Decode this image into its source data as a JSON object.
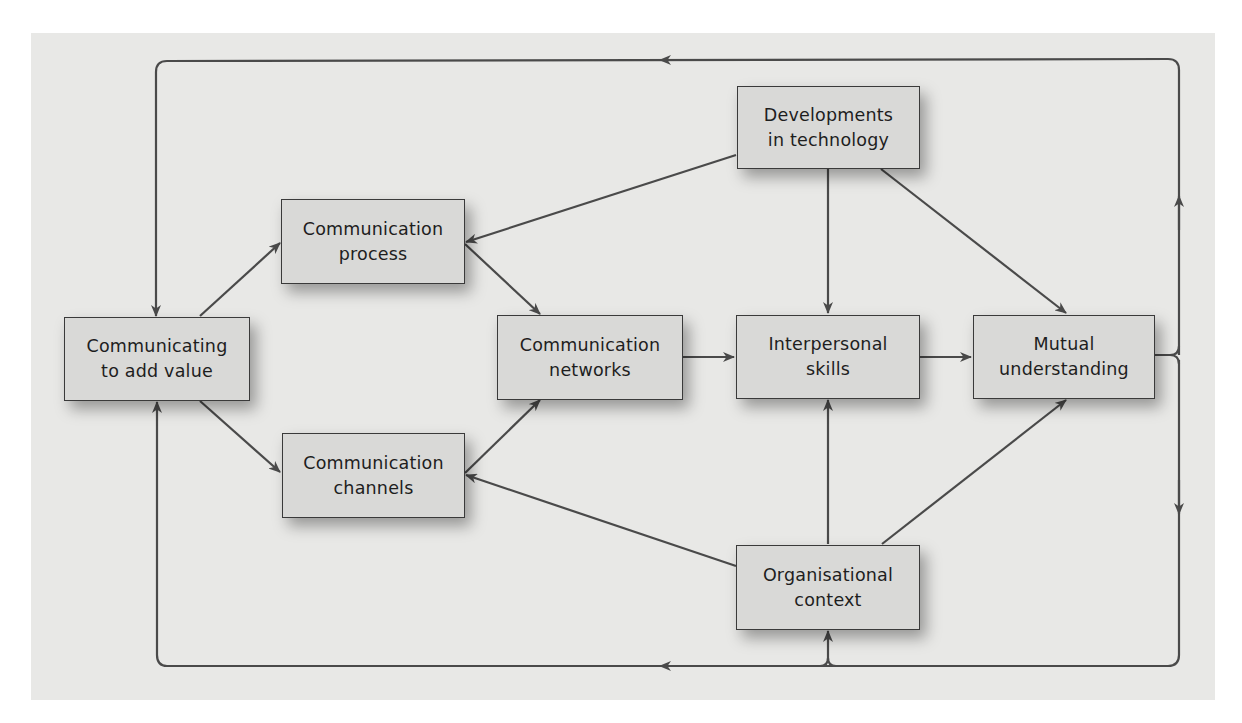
{
  "diagram": {
    "background_color": "#e8e8e6",
    "node_fill": "#d9d9d7",
    "line_color": "#4a4a4a",
    "nodes": {
      "communicating": {
        "line1": "Communicating",
        "line2": "to add value"
      },
      "process": {
        "line1": "Communication",
        "line2": "process"
      },
      "channels": {
        "line1": "Communication",
        "line2": "channels"
      },
      "networks": {
        "line1": "Communication",
        "line2": "networks"
      },
      "technology": {
        "line1": "Developments",
        "line2": "in technology"
      },
      "interpersonal": {
        "line1": "Interpersonal",
        "line2": "skills"
      },
      "mutual": {
        "line1": "Mutual",
        "line2": "understanding"
      },
      "organisational": {
        "line1": "Organisational",
        "line2": "context"
      }
    },
    "edges": [
      {
        "from": "Communicating to add value",
        "to": "Communication process"
      },
      {
        "from": "Communicating to add value",
        "to": "Communication channels"
      },
      {
        "from": "Communication process",
        "to": "Communication networks"
      },
      {
        "from": "Communication channels",
        "to": "Communication networks"
      },
      {
        "from": "Communication networks",
        "to": "Interpersonal skills"
      },
      {
        "from": "Interpersonal skills",
        "to": "Mutual understanding"
      },
      {
        "from": "Developments in technology",
        "to": "Communication process"
      },
      {
        "from": "Developments in technology",
        "to": "Interpersonal skills"
      },
      {
        "from": "Developments in technology",
        "to": "Mutual understanding"
      },
      {
        "from": "Organisational context",
        "to": "Communication channels"
      },
      {
        "from": "Organisational context",
        "to": "Interpersonal skills"
      },
      {
        "from": "Organisational context",
        "to": "Mutual understanding"
      },
      {
        "from": "Mutual understanding",
        "to": "Communicating to add value",
        "via": "top feedback loop"
      },
      {
        "from": "Mutual understanding",
        "to": "Communicating to add value",
        "via": "bottom feedback loop"
      },
      {
        "from": "Mutual understanding",
        "to": "Organisational context",
        "via": "bottom feedback loop"
      }
    ]
  }
}
